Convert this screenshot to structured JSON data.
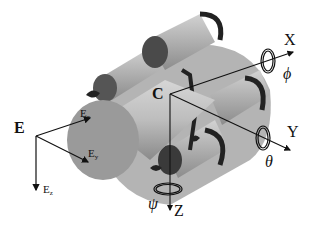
{
  "diagram": {
    "type": "coordinate-frame-illustration",
    "inertial_frame": {
      "label": "E",
      "axes": [
        {
          "label": "E",
          "sub": "x"
        },
        {
          "label": "E",
          "sub": "y"
        },
        {
          "label": "E",
          "sub": "z"
        }
      ]
    },
    "body_frame": {
      "origin_label": "C",
      "axes": [
        {
          "label": "X",
          "rotation": "ϕ"
        },
        {
          "label": "Y",
          "rotation": "θ"
        },
        {
          "label": "Z",
          "rotation": "ψ"
        }
      ]
    },
    "colors": {
      "line": "#111111",
      "body_light": "#c8c8c8",
      "body_mid": "#9a9a9a",
      "body_dark": "#3c3c3c"
    }
  }
}
